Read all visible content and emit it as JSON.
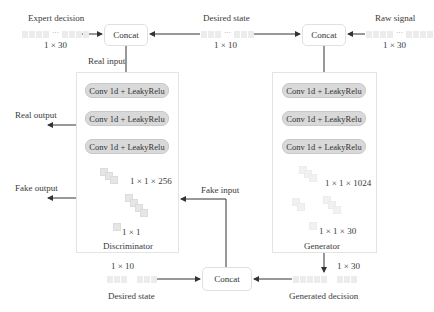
{
  "inputs": {
    "expert_decision": {
      "label": "Expert decision",
      "dim": "1 × 30",
      "ellipsis": "···"
    },
    "desired_state_top": {
      "label": "Desired state",
      "dim": "1 × 10",
      "ellipsis": "···"
    },
    "raw_signal": {
      "label": "Raw signal",
      "dim": "1 × 30",
      "ellipsis": "···"
    }
  },
  "concat": {
    "left_label": "Concat",
    "right_label": "Concat",
    "bottom_label": "Concat"
  },
  "discriminator": {
    "title": "Discriminator",
    "input_label": "Real input",
    "layers": [
      "Conv 1d + LeakyRelu",
      "Conv 1d + LeakyRelu",
      "Conv 1d + LeakyRelu"
    ],
    "feature_dim": "1 × 1 × 256",
    "output_dim": "1 × 1",
    "real_output_label": "Real output",
    "fake_output_label": "Fake output",
    "fake_input_label": "Fake input"
  },
  "generator": {
    "title": "Generator",
    "layers": [
      "Conv 1d + LeakyRelu",
      "Conv 1d + LeakyRelu",
      "Conv 1d + LeakyRelu"
    ],
    "feature_dim": "1 × 1 × 1024",
    "output_dim": "1 × 1 × 30"
  },
  "bottom": {
    "desired_state": {
      "label": "Desired state",
      "dim": "1 × 10"
    },
    "generated_decision": {
      "label": "Generated decision",
      "dim": "1 × 30"
    }
  },
  "colors": {
    "layer_fill": "#d9d9d9",
    "panel_border": "#e4e4e4",
    "arrow": "#333333",
    "cube": "#e6e6e6"
  }
}
